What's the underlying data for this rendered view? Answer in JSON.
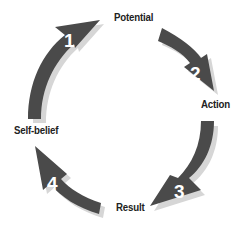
{
  "diagram": {
    "type": "cycle",
    "colors": {
      "arrow": "#4a4a4a",
      "shadow": "#d6d6d6",
      "number": "#ffffff",
      "label": "#222222",
      "background": "#ffffff"
    },
    "steps": [
      {
        "number": "1",
        "label": "Potential"
      },
      {
        "number": "2",
        "label": "Action"
      },
      {
        "number": "3",
        "label": "Result"
      },
      {
        "number": "4",
        "label": "Self-belief"
      }
    ]
  }
}
